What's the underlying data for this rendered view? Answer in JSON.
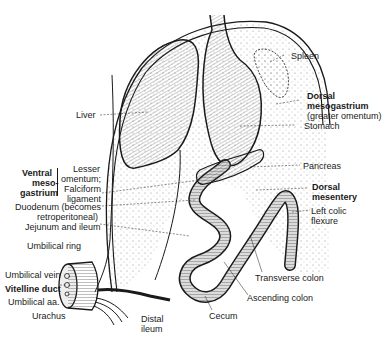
{
  "figure": {
    "colors": {
      "ink": "#1a1a1a",
      "stipple": "#6e6e6e",
      "background": "#ffffff"
    }
  },
  "labels": {
    "spleen": "Spleen",
    "dorsal_mesogastrium": "Dorsal",
    "dorsal_mesogastrium_2": "mesogastrium",
    "greater_omentum": "(greater omentum)",
    "stomach": "Stomach",
    "liver": "Liver",
    "pancreas": "Pancreas",
    "dorsal_mesentery_1": "Dorsal",
    "dorsal_mesentery_2": "mesentery",
    "left_colic_1": "Left colic",
    "left_colic_2": "flexure",
    "ventral_1": "Ventral",
    "ventral_2": "meso-",
    "ventral_3": "gastrium",
    "lesser_1": "Lesser",
    "lesser_2": "omentum;",
    "falciform_1": "Falciform",
    "falciform_2": "ligament",
    "duodenum_1": "Duodenum (becomes",
    "duodenum_2": "retroperitoneal)",
    "jejunum": "Jejunum and ileum",
    "umbilical_ring": "Umbilical ring",
    "umbilical_vein": "Umbilical vein",
    "vitelline_duct": "Vitelline duct",
    "umbilical_aa": "Umbilical aa.",
    "urachus": "Urachus",
    "transverse_colon": "Transverse colon",
    "ascending_colon": "Ascending colon",
    "cecum": "Cecum",
    "distal_1": "Distal",
    "distal_2": "ileum"
  }
}
